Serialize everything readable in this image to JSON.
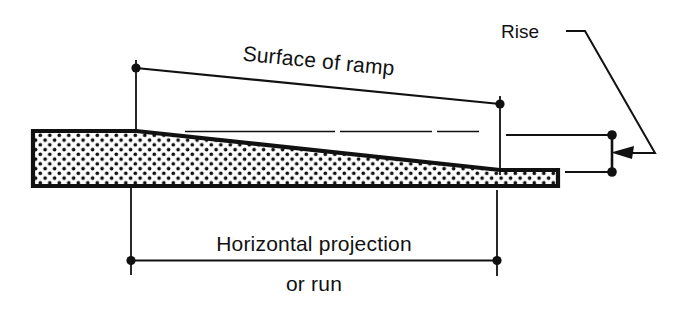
{
  "diagram": {
    "colors": {
      "line": "#111111",
      "fill_background": "#ffffff",
      "stipple": "#111111",
      "page_background": "#ffffff"
    },
    "labels": {
      "surface_of_ramp": "Surface of ramp",
      "horizontal_projection": "Horizontal projection",
      "or_run": "or run",
      "rise": "Rise"
    },
    "dimensions": [
      {
        "name": "surface-of-ramp",
        "label": "Surface of ramp",
        "type": "sloped-dimension",
        "start": [
          136,
          68
        ],
        "end": [
          500,
          104
        ],
        "text_rotation_deg": 5.6,
        "text_anchor": [
          330,
          62
        ]
      },
      {
        "name": "horizontal-projection",
        "label": "Horizontal projection",
        "sublabel": "or run",
        "type": "horizontal-dimension",
        "start": [
          131,
          260
        ],
        "end": [
          497,
          261
        ],
        "text_anchor": [
          314,
          247
        ],
        "sublabel_anchor": [
          314,
          288
        ]
      },
      {
        "name": "rise",
        "label": "Rise",
        "type": "vertical-dimension",
        "start": [
          612,
          135
        ],
        "end": [
          612,
          172
        ],
        "leader_text_anchor": [
          540,
          36
        ]
      }
    ],
    "ramp": {
      "name": "ramp-body",
      "fill_pattern": "stipple-dots",
      "outline_width": 4,
      "top_left": [
        33,
        131
      ],
      "taper_start_x": 136,
      "taper_end_x": 500,
      "right_end_x": 558,
      "bottom_y": 186,
      "thin_end_top_y": 170
    }
  }
}
